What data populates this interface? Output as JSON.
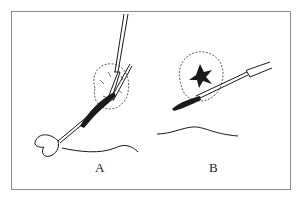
{
  "figure": {
    "panels": [
      {
        "id": "A",
        "label": "A",
        "description": "Forceps grasping and a heart-shaped looped instrument tunneling under a rounded mass"
      },
      {
        "id": "B",
        "label": "B",
        "description": "Probe inserted beneath a rounded mass with star-shaped dark center"
      }
    ],
    "colors": {
      "ink": "#1a1a1a",
      "border": "#8a8a8a",
      "background": "#ffffff"
    }
  }
}
